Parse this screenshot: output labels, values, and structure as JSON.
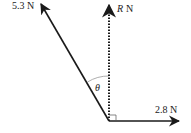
{
  "diagram": {
    "type": "force-diagram",
    "forces": [
      {
        "id": "f1",
        "label": "5.3 N",
        "direction": "up-left",
        "style": "solid"
      },
      {
        "id": "resultant",
        "label_symbol": "R",
        "label_unit": "N",
        "direction": "up",
        "style": "dotted"
      },
      {
        "id": "f2",
        "label": "2.8 N",
        "direction": "right",
        "style": "solid"
      }
    ],
    "angle": {
      "symbol": "θ",
      "between": [
        "5.3 N",
        "R N"
      ]
    },
    "right_angle_marker": {
      "between": [
        "R N",
        "2.8 N"
      ]
    },
    "colors": {
      "stroke": "#1a1a1a",
      "arc": "#999999"
    }
  }
}
